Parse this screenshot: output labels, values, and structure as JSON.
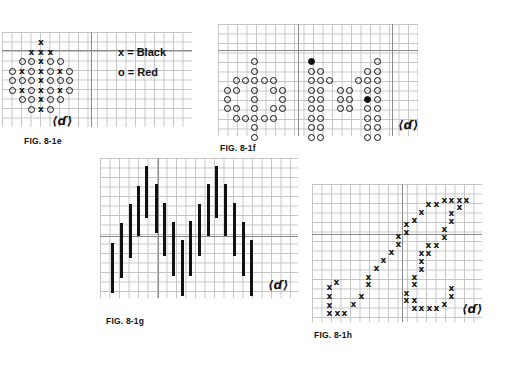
{
  "figures": [
    {
      "id": "fig-8-1e",
      "caption": "FIG. 8-1e",
      "legend": [
        {
          "symbol": "x",
          "label": "Black"
        },
        {
          "symbol": "o",
          "label": "Red"
        }
      ],
      "legend_text": [
        "x = Black",
        "o = Red"
      ],
      "pattern_rows": [
        "   X   ",
        "  XXX  ",
        " OOXOO ",
        "OXOXOXO",
        "OOOXOOO",
        "OXOXOXO",
        " OOXOO ",
        "  OXO  "
      ],
      "signature": "⟨ɗ⟩"
    },
    {
      "id": "fig-8-1f",
      "caption": "FIG. 8-1f",
      "description": "Dot-matrix letters \"φm\" drawn in circles",
      "signature": "⟨ɗ⟩"
    },
    {
      "id": "fig-8-1g",
      "caption": "FIG. 8-1g",
      "description": "Vertical bars forming two peaks (M pattern)",
      "signature": "⟨ɗ⟩"
    },
    {
      "id": "fig-8-1h",
      "caption": "FIG. 8-1h",
      "description": "Script letter drawn in x marks",
      "signature": "⟨ɗ⟩"
    }
  ]
}
